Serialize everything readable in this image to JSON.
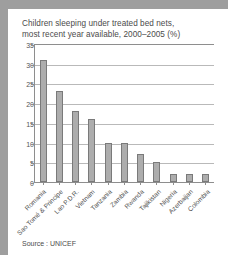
{
  "figure": {
    "title_line1": "Children sleeping under treated bed nets,",
    "title_line2": "most recent year available, 2000–2005 (%)",
    "source": "Source : UNICEF"
  },
  "chart_data": {
    "type": "bar",
    "title": "Children sleeping under treated bed nets, most recent year available, 2000–2005 (%)",
    "xlabel": "",
    "ylabel": "",
    "ylim": [
      0,
      35
    ],
    "yticks": [
      0,
      5,
      10,
      15,
      20,
      25,
      30,
      35
    ],
    "grid": true,
    "legend": null,
    "bar_color": "#adadad",
    "bar_edge_color": "#7a7a7a",
    "categories": [
      "Romania",
      "Sao Tomé & Principe",
      "Lao P.D.R.",
      "Vietnam",
      "Tanzania",
      "Zambia",
      "Rwanda",
      "Tajikistan",
      "Nigeria",
      "Azerbaijan",
      "Colombia"
    ],
    "values": [
      31,
      23,
      18,
      16,
      10,
      10,
      7,
      5,
      2,
      2,
      2
    ]
  }
}
